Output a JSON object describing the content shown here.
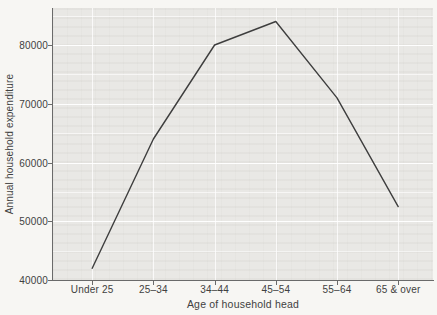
{
  "chart_data": {
    "type": "line",
    "categories": [
      "Under 25",
      "25–34",
      "34–44",
      "45–54",
      "55–64",
      "65 & over"
    ],
    "values": [
      42000,
      64000,
      80000,
      84000,
      71000,
      52500
    ],
    "title": "",
    "xlabel": "Age of household head",
    "ylabel": "Annual household expenditure",
    "ylim": [
      40000,
      86300
    ],
    "yticks": [
      40000,
      50000,
      60000,
      70000,
      80000
    ],
    "ytick_labels": [
      "40000",
      "50000",
      "60000",
      "70000",
      "80000"
    ],
    "grid_step": 5000,
    "grid": "on",
    "legend": "none",
    "line_color": "#3e3e3e",
    "panel_bg": "#e9e8e5",
    "axis_color": "#6a6a6a",
    "text_color": "#414141"
  }
}
